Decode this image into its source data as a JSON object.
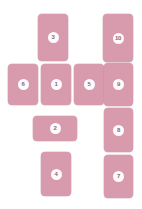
{
  "board": {
    "background_color": "#ffffff",
    "card_color": "#d79bad",
    "badge_color": "#fdfbfc",
    "badge_text_color": "#8f6575",
    "width": 142,
    "height": 209,
    "card_count": 10
  },
  "cards": [
    {
      "label": "3",
      "orientation": "portrait",
      "x": 38,
      "y": 14,
      "w": 30,
      "h": 47
    },
    {
      "label": "10",
      "orientation": "portrait",
      "x": 103,
      "y": 14,
      "w": 30,
      "h": 48
    },
    {
      "label": "6",
      "orientation": "portrait",
      "x": 8,
      "y": 64,
      "w": 30,
      "h": 41
    },
    {
      "label": "1",
      "orientation": "portrait",
      "x": 41,
      "y": 64,
      "w": 30,
      "h": 41
    },
    {
      "label": "5",
      "orientation": "portrait",
      "x": 74,
      "y": 64,
      "w": 30,
      "h": 41
    },
    {
      "label": "9",
      "orientation": "portrait",
      "x": 104,
      "y": 63,
      "w": 29,
      "h": 43
    },
    {
      "label": "2",
      "orientation": "landscape",
      "x": 33,
      "y": 116,
      "w": 44,
      "h": 25
    },
    {
      "label": "8",
      "orientation": "portrait",
      "x": 104,
      "y": 108,
      "w": 29,
      "h": 44
    },
    {
      "label": "4",
      "orientation": "portrait",
      "x": 41,
      "y": 152,
      "w": 30,
      "h": 44
    },
    {
      "label": "7",
      "orientation": "portrait",
      "x": 104,
      "y": 155,
      "w": 29,
      "h": 43
    }
  ]
}
